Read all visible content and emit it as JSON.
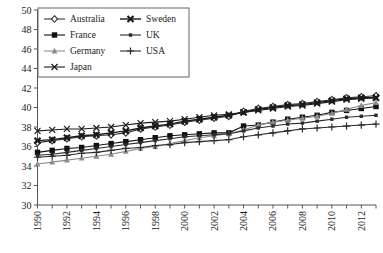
{
  "chart_data": {
    "type": "line",
    "title": "",
    "subtitle": "",
    "xlabel": "",
    "ylabel": "",
    "xlim": [
      1990,
      2013
    ],
    "ylim": [
      30,
      50
    ],
    "ytick_step": 2,
    "xtick_step": 1,
    "xlabel_step": 2,
    "grid": false,
    "legend_position": "top-left",
    "x": [
      1990,
      1991,
      1992,
      1993,
      1994,
      1995,
      1996,
      1997,
      1998,
      1999,
      2000,
      2001,
      2002,
      2003,
      2004,
      2005,
      2006,
      2007,
      2008,
      2009,
      2010,
      2011,
      2012,
      2013
    ],
    "yticks": [
      30,
      32,
      34,
      36,
      38,
      40,
      42,
      44,
      46,
      48,
      50
    ],
    "xticklabels": [
      "1990",
      "1992",
      "1994",
      "1996",
      "1998",
      "2000",
      "2002",
      "2004",
      "2006",
      "2008",
      "2010",
      "2012"
    ],
    "series": [
      {
        "name": "Australia",
        "marker": "diamond-open",
        "color": "#333333",
        "values": [
          36.4,
          36.6,
          36.8,
          37.0,
          37.1,
          37.2,
          37.4,
          37.8,
          38.0,
          38.2,
          38.5,
          38.7,
          38.9,
          39.1,
          39.6,
          39.9,
          40.1,
          40.3,
          40.4,
          40.6,
          40.8,
          41.0,
          41.1,
          41.2
        ]
      },
      {
        "name": "France",
        "marker": "square-filled",
        "color": "#111111",
        "values": [
          35.4,
          35.6,
          35.8,
          35.9,
          36.1,
          36.3,
          36.5,
          36.7,
          36.9,
          37.1,
          37.2,
          37.3,
          37.4,
          37.4,
          38.1,
          38.2,
          38.5,
          38.8,
          39.0,
          39.2,
          39.5,
          39.7,
          39.9,
          40.1
        ]
      },
      {
        "name": "Germany",
        "marker": "triangle-gray",
        "color": "#8c8c8c",
        "values": [
          34.2,
          34.4,
          34.6,
          34.8,
          35.0,
          35.2,
          35.5,
          35.8,
          36.0,
          36.3,
          36.6,
          36.9,
          37.1,
          37.3,
          37.7,
          38.2,
          38.5,
          38.7,
          38.9,
          39.1,
          39.4,
          39.8,
          40.2,
          40.5
        ]
      },
      {
        "name": "Japan",
        "marker": "cross-x",
        "color": "#1a1a1a",
        "values": [
          37.6,
          37.7,
          37.8,
          37.8,
          37.9,
          38.0,
          38.2,
          38.4,
          38.5,
          38.6,
          38.8,
          39.0,
          39.2,
          39.3,
          39.5,
          39.7,
          39.9,
          40.1,
          40.2,
          40.4,
          40.6,
          40.8,
          40.9,
          41.0
        ]
      },
      {
        "name": "Sweden",
        "marker": "cross-x-bold",
        "color": "#1a1a1a",
        "values": [
          36.6,
          36.7,
          36.9,
          37.1,
          37.2,
          37.4,
          37.6,
          37.9,
          38.1,
          38.3,
          38.6,
          38.8,
          39.0,
          39.2,
          39.5,
          39.8,
          40.0,
          40.2,
          40.3,
          40.5,
          40.7,
          40.9,
          41.0,
          41.0
        ]
      },
      {
        "name": "UK",
        "marker": "square-small",
        "color": "#2b2b2b",
        "values": [
          35.1,
          35.2,
          35.4,
          35.6,
          35.8,
          36.0,
          36.2,
          36.4,
          36.6,
          36.8,
          37.0,
          37.1,
          37.2,
          37.3,
          37.6,
          37.9,
          38.1,
          38.3,
          38.4,
          38.6,
          38.8,
          39.0,
          39.1,
          39.2
        ]
      },
      {
        "name": "USA",
        "marker": "plus",
        "color": "#2b2b2b",
        "values": [
          34.9,
          35.0,
          35.1,
          35.3,
          35.4,
          35.6,
          35.8,
          35.9,
          36.1,
          36.2,
          36.4,
          36.5,
          36.6,
          36.7,
          37.0,
          37.2,
          37.4,
          37.6,
          37.8,
          37.9,
          38.0,
          38.1,
          38.2,
          38.3
        ]
      }
    ]
  },
  "legend": {
    "entries": [
      {
        "label": "Australia"
      },
      {
        "label": "Sweden"
      },
      {
        "label": "France"
      },
      {
        "label": "UK"
      },
      {
        "label": "Germany"
      },
      {
        "label": "USA"
      },
      {
        "label": "Japan"
      }
    ]
  }
}
